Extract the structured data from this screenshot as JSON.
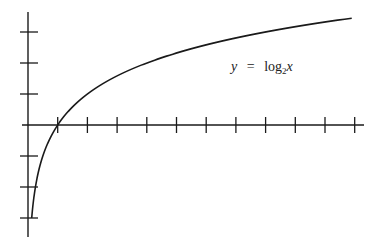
{
  "chart_data": {
    "type": "line",
    "title": "",
    "xlabel": "",
    "ylabel": "",
    "annotation": {
      "lhs": "y",
      "eq": "=",
      "fn": "log",
      "base": "2",
      "arg": "x"
    },
    "function": "y = log2(x)",
    "x": [
      0.125,
      0.25,
      0.5,
      1,
      2,
      3,
      4,
      5,
      6,
      7,
      8,
      9,
      10,
      10.9
    ],
    "series": [
      {
        "name": "y = log2 x",
        "values": [
          -3,
          -2,
          -1,
          0,
          1,
          1.585,
          2,
          2.322,
          2.585,
          2.807,
          3,
          3.17,
          3.322,
          3.45
        ]
      }
    ],
    "xlim": [
      0,
      11.2
    ],
    "ylim": [
      -3.6,
      3.6
    ],
    "x_ticks": [
      1,
      2,
      3,
      4,
      5,
      6,
      7,
      8,
      9,
      10,
      11
    ],
    "y_ticks": [
      -3,
      -2,
      -1,
      1,
      2,
      3
    ],
    "tick_labels_shown": false,
    "grid": false,
    "legend": "none",
    "color": "#1a1a1a"
  },
  "layout": {
    "origin_px": [
      28,
      125
    ],
    "x_unit_px": 29.7,
    "y_unit_px": 31,
    "x_axis_end_px": 364,
    "y_axis_top_px": 12,
    "y_axis_bottom_px": 237
  }
}
